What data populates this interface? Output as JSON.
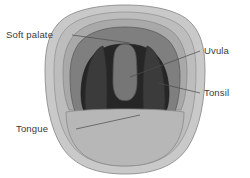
{
  "figure": {
    "type": "anatomical-illustration",
    "background_color": "#ffffff"
  },
  "labels": [
    {
      "id": "soft-palate",
      "text": "Soft palate",
      "x": 6,
      "y": 38,
      "anchor": "start",
      "leader": "M 72 35 L 130 43"
    },
    {
      "id": "uvula",
      "text": "Uvula",
      "x": 204,
      "y": 54,
      "anchor": "start",
      "leader": "M 200 51 L 130 77"
    },
    {
      "id": "tonsil",
      "text": "Tonsil",
      "x": 204,
      "y": 96,
      "anchor": "start",
      "leader": "M 200 93 L 158 83"
    },
    {
      "id": "tongue",
      "text": "Tongue",
      "x": 16,
      "y": 132,
      "anchor": "start",
      "leader": "M 76 129 L 140 115"
    }
  ],
  "regions": [
    {
      "id": "outer-lip-ring",
      "name": "outer lip / cheek ring",
      "color": "#c9c9c9",
      "stroke": "#8d8d8d"
    },
    {
      "id": "inner-lip-ring",
      "name": "inner lip ring",
      "color": "#bdbdbd",
      "stroke": "#8d8d8d"
    },
    {
      "id": "hard-palate",
      "name": "hard palate",
      "color": "#a9a9a9",
      "stroke": "#8a8a8a"
    },
    {
      "id": "soft-palate",
      "name": "soft palate",
      "color": "#7f7f7f",
      "stroke": "#5c5c5c"
    },
    {
      "id": "tonsil-left",
      "name": "left tonsil",
      "color": "#3b3b3b",
      "stroke": "#2a2a2a"
    },
    {
      "id": "tonsil-right",
      "name": "right tonsil",
      "color": "#3b3b3b",
      "stroke": "#2a2a2a"
    },
    {
      "id": "pharynx",
      "name": "pharynx / throat cavity",
      "color": "#262626",
      "stroke": "#1c1c1c"
    },
    {
      "id": "uvula",
      "name": "uvula",
      "color": "#767676",
      "stroke": "#555555"
    },
    {
      "id": "tongue",
      "name": "tongue",
      "color": "#b7b7b7",
      "stroke": "#8a8a8a"
    }
  ],
  "palette": {
    "label_text": "#3a3a3a",
    "leader_line": "#4a4a4a"
  }
}
